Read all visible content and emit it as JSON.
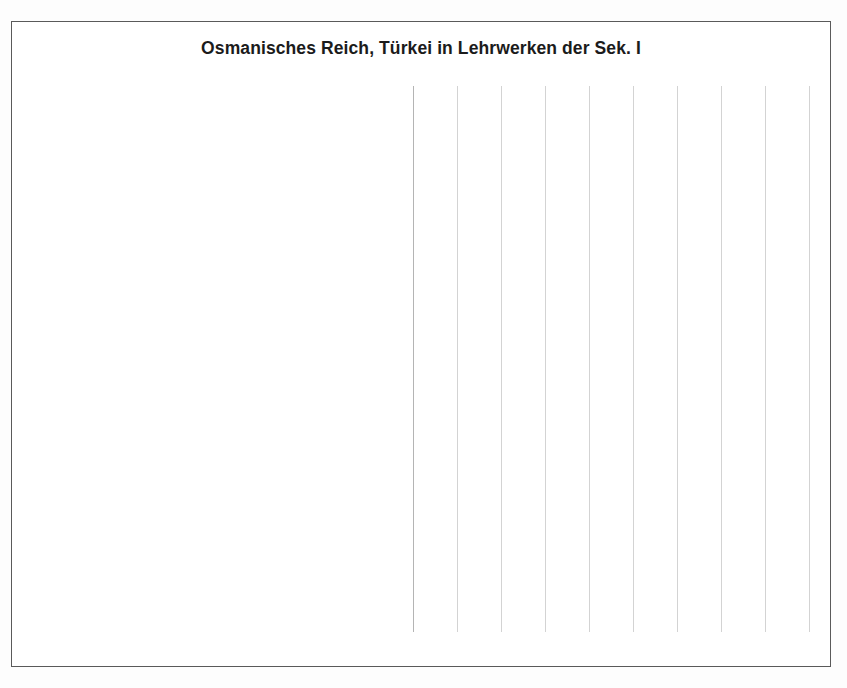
{
  "chart_data": {
    "type": "bar",
    "orientation": "horizontal",
    "title": "Osmanisches Reich, Türkei in Lehrwerken der Sek. I",
    "xlabel": "",
    "ylabel": "",
    "xlim": [
      0,
      18
    ],
    "xticks": [
      0,
      2,
      4,
      6,
      8,
      10,
      12,
      14,
      16,
      18
    ],
    "grid": "vertical",
    "legend": "none",
    "bar_color": "#5b8ed4",
    "categories": [
      "Trio Gesellschaftslehre 7/8 (2012)",
      "Heimat und Welt PLUS 7/8 (2013)",
      "Gesellschaft bewusst 2 (2015)",
      "Horizonte 2 (2008)",
      "Geschichte Real 3 (2013)",
      "Mitmischen (2015)",
      "Forum Geschichte Kompakt 2. Teilband 1 (2009)",
      "Forum Geschichte Kompakt 2-Gesamtband (2008)",
      "Entdecken und Verstehen 2 (2015)",
      "Entdecken und Verstehen 2/3 (2012)",
      "Die Reise in die Vergangenheit 2 (2013)",
      "Das IGL-Buch 2 (2013)",
      "Menschen, Zeiten, Räume 2 (2012)",
      "Geschichte und Gegenwart 3 (2013)",
      "Denkmal 3 (2012)",
      "Das waren Zeiten 2 (2009)",
      "Entdecken und Verstehen 3 (2012)",
      "Zeitreise 3 (2012)",
      "Mosaik D2 - Der Geschichte auf der Spur (2008)",
      "Geschichte und Geschehen 2 (2016)",
      "Zeiten und Menschen 2 (2017)"
    ],
    "values": [
      0,
      2,
      2,
      3,
      4,
      5,
      5,
      5,
      6,
      7,
      7,
      8,
      8,
      8,
      10,
      10,
      10,
      10,
      13,
      16,
      17
    ]
  }
}
